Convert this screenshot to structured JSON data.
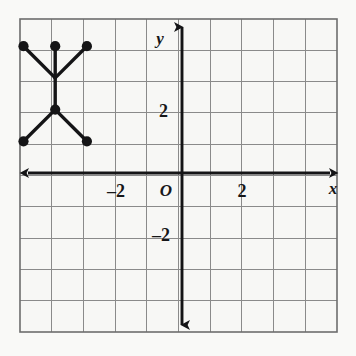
{
  "figure": {
    "background_color": "#f8f8f6",
    "frame": {
      "color": "#6d6d6d",
      "left": 20,
      "top": 19,
      "right": 337,
      "bottom": 332
    },
    "grid": {
      "color": "#8a8a8a",
      "cell_px": 31.7,
      "columns": 10,
      "rows": 10,
      "visible": true
    },
    "axes": {
      "color": "#141416",
      "x_axis": {
        "label": "x",
        "pixel_y": 173,
        "arrow_both_ends": true
      },
      "y_axis": {
        "label": "y",
        "pixel_x": 182,
        "arrow_both_ends": true
      },
      "origin_label": "O",
      "x_range": [
        -5,
        5
      ],
      "y_range": [
        -5,
        5
      ]
    },
    "tick_labels": {
      "x_negative": "–2",
      "x_positive": "2",
      "y_positive": "2",
      "y_negative": "–2"
    }
  },
  "chart_data": {
    "type": "scatter",
    "title": "",
    "xlabel": "x",
    "ylabel": "y",
    "xlim": [
      -5,
      5
    ],
    "ylim": [
      -5,
      5
    ],
    "grid": true,
    "legend": null,
    "marker_color": "#141416",
    "segment_color": "#141416",
    "points": [
      {
        "name": "top-left-vertex",
        "x": -5,
        "y": 4,
        "has_dot": true
      },
      {
        "name": "top-middle-vertex",
        "x": -4,
        "y": 4,
        "has_dot": true
      },
      {
        "name": "top-right-vertex",
        "x": -3,
        "y": 4,
        "has_dot": true
      },
      {
        "name": "upper-junction",
        "x": -4,
        "y": 3,
        "has_dot": false
      },
      {
        "name": "center-vertex",
        "x": -4,
        "y": 2,
        "has_dot": true
      },
      {
        "name": "bottom-left-vertex",
        "x": -5,
        "y": 1,
        "has_dot": true
      },
      {
        "name": "bottom-right-vertex",
        "x": -3,
        "y": 1,
        "has_dot": true
      }
    ],
    "segments": [
      {
        "from": [
          -5,
          4
        ],
        "to": [
          -4,
          3
        ]
      },
      {
        "from": [
          -4,
          4
        ],
        "to": [
          -4,
          3
        ]
      },
      {
        "from": [
          -3,
          4
        ],
        "to": [
          -4,
          3
        ]
      },
      {
        "from": [
          -4,
          3
        ],
        "to": [
          -4,
          2
        ]
      },
      {
        "from": [
          -4,
          2
        ],
        "to": [
          -5,
          1
        ]
      },
      {
        "from": [
          -4,
          2
        ],
        "to": [
          -3,
          1
        ]
      }
    ]
  }
}
